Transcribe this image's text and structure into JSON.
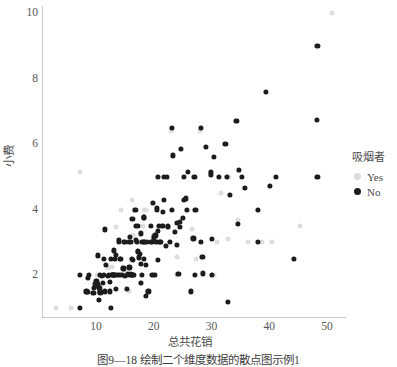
{
  "figure": {
    "caption": "图9—18  绘制二个维度数据的散点图示例1"
  },
  "legend": {
    "title": "吸烟者",
    "entries": [
      {
        "label": "Yes",
        "color": "#dcdcdc"
      },
      {
        "label": "No",
        "color": "#1c1c1c"
      }
    ]
  },
  "axes": {
    "xlabel": "总共花销",
    "ylabel": "小费",
    "xticks": [
      "10",
      "20",
      "30",
      "40",
      "50"
    ],
    "yticks": [
      "2",
      "4",
      "6",
      "8",
      "10"
    ]
  },
  "chart_data": {
    "type": "scatter",
    "title": "",
    "xlabel": "总共花销",
    "ylabel": "小费",
    "xlim": [
      3,
      53
    ],
    "ylim": [
      0.6,
      10.4
    ],
    "xticks": [
      10,
      20,
      30,
      40,
      50
    ],
    "yticks": [
      2,
      4,
      6,
      8,
      10
    ],
    "grid": false,
    "legend_title": "吸烟者",
    "legend_position": "right",
    "series": [
      {
        "name": "No",
        "color": "#1c1c1c",
        "marker": "circle",
        "points": [
          [
            7.25,
            1.0
          ],
          [
            7.25,
            2.0
          ],
          [
            8.35,
            1.5
          ],
          [
            8.52,
            1.48
          ],
          [
            8.58,
            1.92
          ],
          [
            8.77,
            2.0
          ],
          [
            9.55,
            1.45
          ],
          [
            9.6,
            1.6
          ],
          [
            9.78,
            1.73
          ],
          [
            10.07,
            1.83
          ],
          [
            10.27,
            1.71
          ],
          [
            10.29,
            2.6
          ],
          [
            10.33,
            1.67
          ],
          [
            10.34,
            1.66
          ],
          [
            10.51,
            1.25
          ],
          [
            10.59,
            1.61
          ],
          [
            10.63,
            2.0
          ],
          [
            10.65,
            1.5
          ],
          [
            10.77,
            1.47
          ],
          [
            11.02,
            1.98
          ],
          [
            11.24,
            1.76
          ],
          [
            11.35,
            2.5
          ],
          [
            11.38,
            2.0
          ],
          [
            11.59,
            1.5
          ],
          [
            11.61,
            3.39
          ],
          [
            11.69,
            2.31
          ],
          [
            12.02,
            1.97
          ],
          [
            12.26,
            2.0
          ],
          [
            12.43,
            1.8
          ],
          [
            12.46,
            1.5
          ],
          [
            12.54,
            2.5
          ],
          [
            12.6,
            1.0
          ],
          [
            12.69,
            2.0
          ],
          [
            12.74,
            2.01
          ],
          [
            13.0,
            2.0
          ],
          [
            13.03,
            2.0
          ],
          [
            13.13,
            2.0
          ],
          [
            13.16,
            2.75
          ],
          [
            13.27,
            2.5
          ],
          [
            13.37,
            2.0
          ],
          [
            13.39,
            2.61
          ],
          [
            13.42,
            1.58
          ],
          [
            13.81,
            2.0
          ],
          [
            13.94,
            3.06
          ],
          [
            14.0,
            3.0
          ],
          [
            14.07,
            2.5
          ],
          [
            14.15,
            2.0
          ],
          [
            14.26,
            2.5
          ],
          [
            14.52,
            2.0
          ],
          [
            14.73,
            2.2
          ],
          [
            14.83,
            3.02
          ],
          [
            15.04,
            1.96
          ],
          [
            15.06,
            3.0
          ],
          [
            15.42,
            1.57
          ],
          [
            15.48,
            2.02
          ],
          [
            15.69,
            3.0
          ],
          [
            15.77,
            2.23
          ],
          [
            15.81,
            3.16
          ],
          [
            15.98,
            2.03
          ],
          [
            15.98,
            3.0
          ],
          [
            16.0,
            2.0
          ],
          [
            16.21,
            2.0
          ],
          [
            16.27,
            2.5
          ],
          [
            16.29,
            3.71
          ],
          [
            16.31,
            2.0
          ],
          [
            16.45,
            2.47
          ],
          [
            16.49,
            2.0
          ],
          [
            16.82,
            4.0
          ],
          [
            16.93,
            3.07
          ],
          [
            16.97,
            3.5
          ],
          [
            17.07,
            3.0
          ],
          [
            17.26,
            2.74
          ],
          [
            17.29,
            2.71
          ],
          [
            17.31,
            3.5
          ],
          [
            17.46,
            2.54
          ],
          [
            17.59,
            2.64
          ],
          [
            17.78,
            3.27
          ],
          [
            17.81,
            2.34
          ],
          [
            17.82,
            1.75
          ],
          [
            17.89,
            2.0
          ],
          [
            18.04,
            3.0
          ],
          [
            18.24,
            3.76
          ],
          [
            18.29,
            3.0
          ],
          [
            18.29,
            3.76
          ],
          [
            18.35,
            2.5
          ],
          [
            18.43,
            3.0
          ],
          [
            18.64,
            1.36
          ],
          [
            18.69,
            2.31
          ],
          [
            18.78,
            3.0
          ],
          [
            19.08,
            1.5
          ],
          [
            19.44,
            3.0
          ],
          [
            19.49,
            3.51
          ],
          [
            19.65,
            3.0
          ],
          [
            19.77,
            2.0
          ],
          [
            19.81,
            4.19
          ],
          [
            20.08,
            3.15
          ],
          [
            20.23,
            2.01
          ],
          [
            20.29,
            3.21
          ],
          [
            20.45,
            3.0
          ],
          [
            20.49,
            4.06
          ],
          [
            20.53,
            4.0
          ],
          [
            20.65,
            3.35
          ],
          [
            20.69,
            2.45
          ],
          [
            20.69,
            5.0
          ],
          [
            20.9,
            3.5
          ],
          [
            21.01,
            3.0
          ],
          [
            21.16,
            3.0
          ],
          [
            21.5,
            3.5
          ],
          [
            21.58,
            3.92
          ],
          [
            21.7,
            4.3
          ],
          [
            21.7,
            5.0
          ],
          [
            22.12,
            2.88
          ],
          [
            22.23,
            5.0
          ],
          [
            22.42,
            3.48
          ],
          [
            22.49,
            3.5
          ],
          [
            22.76,
            3.0
          ],
          [
            23.1,
            4.0
          ],
          [
            23.17,
            6.5
          ],
          [
            23.33,
            5.65
          ],
          [
            23.68,
            3.31
          ],
          [
            24.06,
            3.6
          ],
          [
            24.08,
            2.92
          ],
          [
            24.27,
            2.03
          ],
          [
            24.52,
            3.48
          ],
          [
            24.59,
            3.61
          ],
          [
            24.71,
            5.85
          ],
          [
            25.0,
            3.75
          ],
          [
            25.21,
            4.29
          ],
          [
            25.28,
            5.0
          ],
          [
            25.56,
            4.34
          ],
          [
            25.71,
            4.0
          ],
          [
            25.89,
            5.16
          ],
          [
            26.41,
            1.5
          ],
          [
            26.88,
            3.12
          ],
          [
            27.05,
            5.0
          ],
          [
            27.18,
            2.0
          ],
          [
            27.2,
            4.0
          ],
          [
            28.15,
            3.0
          ],
          [
            28.17,
            6.5
          ],
          [
            28.44,
            2.56
          ],
          [
            28.55,
            2.05
          ],
          [
            29.03,
            5.92
          ],
          [
            29.85,
            5.14
          ],
          [
            29.93,
            5.07
          ],
          [
            30.06,
            2.0
          ],
          [
            30.14,
            3.09
          ],
          [
            30.4,
            5.6
          ],
          [
            31.27,
            5.0
          ],
          [
            32.4,
            6.0
          ],
          [
            32.68,
            5.0
          ],
          [
            32.83,
            1.17
          ],
          [
            33.25,
            4.45
          ],
          [
            34.3,
            6.7
          ],
          [
            34.63,
            3.55
          ],
          [
            34.81,
            5.2
          ],
          [
            35.26,
            5.0
          ],
          [
            35.83,
            4.67
          ],
          [
            38.01,
            3.0
          ],
          [
            38.07,
            4.0
          ],
          [
            39.42,
            7.58
          ],
          [
            40.17,
            4.73
          ],
          [
            41.19,
            5.0
          ],
          [
            44.3,
            2.5
          ],
          [
            48.27,
            6.73
          ],
          [
            48.33,
            9.0
          ],
          [
            48.33,
            5.0
          ]
        ]
      },
      {
        "name": "Yes",
        "color": "#dedede",
        "marker": "circle",
        "points": [
          [
            3.07,
            1.0
          ],
          [
            5.75,
            1.0
          ],
          [
            7.25,
            5.15
          ],
          [
            8.58,
            1.92
          ],
          [
            9.55,
            1.45
          ],
          [
            10.07,
            1.83
          ],
          [
            10.09,
            2.0
          ],
          [
            10.51,
            1.25
          ],
          [
            10.59,
            1.61
          ],
          [
            10.63,
            2.0
          ],
          [
            11.17,
            1.5
          ],
          [
            11.59,
            1.5
          ],
          [
            12.03,
            1.5
          ],
          [
            12.16,
            2.2
          ],
          [
            12.46,
            1.5
          ],
          [
            12.6,
            1.0
          ],
          [
            12.76,
            2.23
          ],
          [
            13.0,
            2.0
          ],
          [
            13.27,
            2.5
          ],
          [
            13.42,
            3.48
          ],
          [
            13.81,
            2.0
          ],
          [
            13.94,
            3.06
          ],
          [
            14.31,
            4.0
          ],
          [
            14.73,
            2.2
          ],
          [
            15.01,
            2.09
          ],
          [
            15.38,
            3.0
          ],
          [
            15.53,
            3.0
          ],
          [
            15.69,
            1.5
          ],
          [
            15.95,
            2.0
          ],
          [
            16.0,
            2.0
          ],
          [
            16.21,
            2.0
          ],
          [
            16.27,
            2.5
          ],
          [
            16.32,
            4.3
          ],
          [
            16.47,
            3.23
          ],
          [
            16.58,
            4.0
          ],
          [
            17.07,
            3.0
          ],
          [
            17.26,
            2.74
          ],
          [
            17.46,
            2.54
          ],
          [
            17.51,
            3.0
          ],
          [
            17.82,
            1.75
          ],
          [
            18.15,
            3.5
          ],
          [
            18.28,
            4.0
          ],
          [
            18.71,
            4.0
          ],
          [
            19.08,
            1.5
          ],
          [
            19.44,
            3.0
          ],
          [
            19.81,
            4.19
          ],
          [
            19.82,
            3.18
          ],
          [
            20.08,
            3.15
          ],
          [
            20.23,
            2.01
          ],
          [
            20.29,
            3.21
          ],
          [
            20.49,
            4.06
          ],
          [
            20.76,
            5.0
          ],
          [
            21.01,
            3.0
          ],
          [
            21.5,
            3.5
          ],
          [
            22.12,
            2.88
          ],
          [
            22.42,
            3.48
          ],
          [
            23.1,
            4.0
          ],
          [
            23.17,
            6.5
          ],
          [
            23.33,
            5.65
          ],
          [
            23.68,
            3.31
          ],
          [
            23.95,
            2.55
          ],
          [
            24.01,
            2.0
          ],
          [
            24.06,
            3.6
          ],
          [
            24.52,
            3.48
          ],
          [
            24.71,
            5.85
          ],
          [
            25.0,
            3.75
          ],
          [
            25.21,
            4.29
          ],
          [
            25.71,
            4.0
          ],
          [
            26.59,
            3.41
          ],
          [
            26.86,
            3.14
          ],
          [
            27.28,
            4.0
          ],
          [
            27.28,
            2.5
          ],
          [
            28.17,
            6.5
          ],
          [
            28.44,
            2.56
          ],
          [
            29.03,
            5.92
          ],
          [
            29.85,
            5.14
          ],
          [
            30.06,
            2.0
          ],
          [
            30.46,
            2.0
          ],
          [
            30.9,
            3.0
          ],
          [
            31.27,
            5.0
          ],
          [
            31.71,
            4.5
          ],
          [
            32.9,
            3.11
          ],
          [
            32.68,
            5.0
          ],
          [
            33.25,
            4.45
          ],
          [
            34.3,
            6.7
          ],
          [
            34.65,
            3.68
          ],
          [
            34.83,
            5.17
          ],
          [
            35.83,
            4.67
          ],
          [
            36.31,
            3.0
          ],
          [
            38.07,
            4.0
          ],
          [
            38.73,
            3.0
          ],
          [
            40.17,
            4.73
          ],
          [
            40.55,
            3.0
          ],
          [
            44.3,
            2.5
          ],
          [
            45.35,
            3.5
          ],
          [
            50.81,
            10.0
          ],
          [
            24.27,
            2.03
          ],
          [
            15.98,
            3.0
          ],
          [
            22.76,
            3.0
          ],
          [
            24.08,
            2.92
          ],
          [
            22.23,
            5.0
          ],
          [
            23.0,
            6.4
          ],
          [
            28.0,
            6.4
          ],
          [
            33.0,
            5.0
          ]
        ]
      }
    ]
  }
}
